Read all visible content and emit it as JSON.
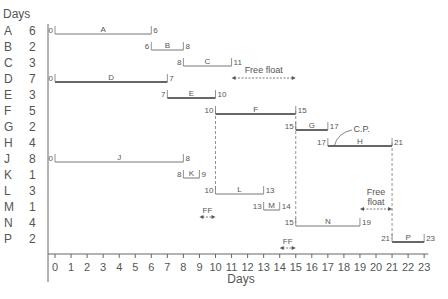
{
  "chart_data": {
    "type": "gantt",
    "title": "",
    "ylabel": "Days",
    "xlabel": "Days",
    "x_ticks": [
      0,
      1,
      2,
      3,
      4,
      5,
      6,
      7,
      8,
      9,
      10,
      11,
      12,
      13,
      14,
      15,
      16,
      17,
      18,
      19,
      20,
      21,
      22,
      23
    ],
    "xlim": [
      0,
      23
    ],
    "activities": [
      {
        "name": "A",
        "duration": 6,
        "start": 0,
        "end": 6,
        "critical": false
      },
      {
        "name": "B",
        "duration": 2,
        "start": 6,
        "end": 8,
        "critical": false
      },
      {
        "name": "C",
        "duration": 3,
        "start": 8,
        "end": 11,
        "critical": false
      },
      {
        "name": "D",
        "duration": 7,
        "start": 0,
        "end": 7,
        "critical": true
      },
      {
        "name": "E",
        "duration": 3,
        "start": 7,
        "end": 10,
        "critical": true
      },
      {
        "name": "F",
        "duration": 5,
        "start": 10,
        "end": 15,
        "critical": true
      },
      {
        "name": "G",
        "duration": 2,
        "start": 15,
        "end": 17,
        "critical": true
      },
      {
        "name": "H",
        "duration": 4,
        "start": 17,
        "end": 21,
        "critical": true
      },
      {
        "name": "J",
        "duration": 8,
        "start": 0,
        "end": 8,
        "critical": false
      },
      {
        "name": "K",
        "duration": 1,
        "start": 8,
        "end": 9,
        "critical": false
      },
      {
        "name": "L",
        "duration": 3,
        "start": 10,
        "end": 13,
        "critical": false
      },
      {
        "name": "M",
        "duration": 1,
        "start": 13,
        "end": 14,
        "critical": false
      },
      {
        "name": "N",
        "duration": 4,
        "start": 15,
        "end": 19,
        "critical": false
      },
      {
        "name": "P",
        "duration": 2,
        "start": 21,
        "end": 23,
        "critical": true
      }
    ],
    "annotations": [
      {
        "text": "Free float",
        "row": "C",
        "from": 11,
        "to": 15,
        "offset_rows": 1
      },
      {
        "text": "C.P.",
        "row": "H",
        "x": 18
      },
      {
        "text": "FF",
        "row": "M",
        "from": 9,
        "to": 10
      },
      {
        "text": "FF",
        "row": "P",
        "from": 14,
        "to": 15
      },
      {
        "text": "Free float",
        "row": "M",
        "from": 19,
        "to": 21,
        "multiline": [
          "Free",
          "float"
        ]
      }
    ],
    "dashed_verticals": [
      10,
      15,
      21
    ]
  }
}
